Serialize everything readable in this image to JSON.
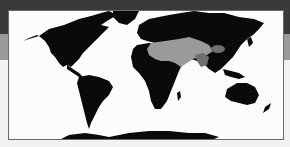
{
  "map": {
    "title": "",
    "projection": "world",
    "colors": {
      "land": "#0a0a0a",
      "highlight_primary": "#9a9a9a",
      "highlight_secondary": "#6e6e6e",
      "ocean": "#fcfcfc",
      "frame_border": "#6a6a6a"
    },
    "highlighted_regions": [
      {
        "name": "north-africa-middle-east-central-asia",
        "shade": "light-gray"
      },
      {
        "name": "south-asia-west",
        "shade": "dark-gray"
      },
      {
        "name": "tibet-plateau",
        "shade": "dark-gray"
      }
    ]
  },
  "background": {
    "top_band": "#3a3a3a",
    "middle_band": "#9a9a9a",
    "bottom_band": "#f2f2f2"
  }
}
